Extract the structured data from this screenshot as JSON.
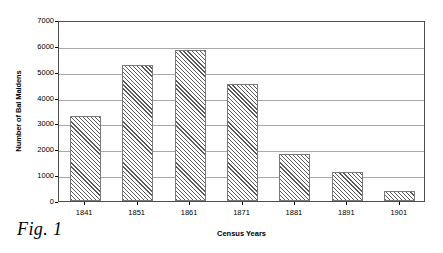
{
  "figure": {
    "caption": "Fig. 1"
  },
  "chart_data": {
    "type": "bar",
    "title": "",
    "subtitle": "",
    "xlabel": "Census Years",
    "ylabel": "Number of Bal Maidens",
    "categories": [
      "1841",
      "1851",
      "1861",
      "1871",
      "1881",
      "1891",
      "1901"
    ],
    "values": [
      3270,
      5270,
      5840,
      4540,
      1810,
      1140,
      390
    ],
    "series": [
      {
        "name": "Number of Bal Maidens",
        "values": [
          3270,
          5270,
          5840,
          4540,
          1810,
          1140,
          390
        ]
      }
    ],
    "ylim": [
      0,
      7000
    ],
    "ytick_values": [
      0,
      1000,
      2000,
      3000,
      4000,
      5000,
      6000,
      7000
    ],
    "ytick_labels": [
      "0",
      "1000",
      "2000",
      "3000",
      "4000",
      "5000",
      "6000",
      "7000"
    ],
    "grid": "horizontal",
    "legend": "none",
    "bar_fill": "diagonal-hatch",
    "colors": {
      "bar_hatch": "#5a5a5a",
      "bar_background": "#ffffff",
      "bar_border": "#7a7a7a",
      "gridline": "#a8a8a8",
      "axis": "#4d4d4d",
      "text": "#000000",
      "plot_background": "#ffffff"
    }
  }
}
